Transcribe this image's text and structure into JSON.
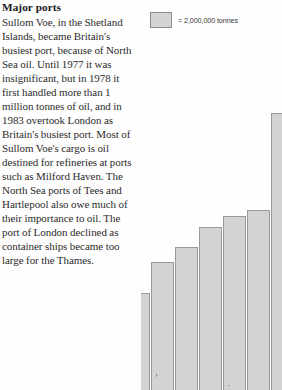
{
  "article": {
    "heading": "Major ports",
    "body": "Sullom Voe, in the Shetland Islands, became Britain's busiest port, because of North Sea oil. Until 1977 it was insignificant, but in 1978 it first handled more than 1 million tonnes of oil, and in 1983 overtook London as Britain's busiest port. Most of Sullom Voe's cargo is oil destined for refineries at ports such as Milford Haven. The North Sea ports of Tees and Hartlepool also owe much of their importance to oil. The port of London declined as container ships became too large for the Thames."
  },
  "legend": {
    "label": "= 2,000,000 tonnes",
    "swatch_color": "#d4d4d4",
    "swatch_border": "#8e8e8e"
  },
  "chart_data": {
    "type": "bar",
    "title": "Major ports",
    "xlabel": "",
    "ylabel": "",
    "unit": "tonnes",
    "legend_unit_value": 2000000,
    "legend_position": "top-left",
    "grid": false,
    "note": "Horizontally cropped bar chart; only the right-hand tail of an ascending series is visible. Bars are clipped at the bottom of the page and the tallest bar is clipped at the top.",
    "categories": [
      "Manchester",
      "Birmingham",
      "Southampton",
      "Grimsby & Immingham",
      "Tees & Hartlepool",
      "Forth",
      "Milford Haven",
      "London",
      "Sullom Voe"
    ],
    "visible_labels": [
      "nningham",
      "ton",
      "apool",
      "th"
    ],
    "values": [
      3,
      10,
      15,
      19,
      22,
      23,
      33,
      40,
      55
    ],
    "ylim": [
      0,
      58
    ],
    "bar_fill": "#d3d3d3",
    "bar_stroke": "#9a9a9a"
  },
  "bars": [
    {
      "name": "bar-partial-left",
      "left": -14,
      "width": 23,
      "height": 97,
      "label": ""
    },
    {
      "name": "bar-birmingham",
      "left": 10,
      "width": 23,
      "height": 128,
      "label": "nningham"
    },
    {
      "name": "bar-southampton",
      "left": 34,
      "width": 23,
      "height": 143,
      "label": "ton"
    },
    {
      "name": "bar-immingham",
      "left": 58,
      "width": 23,
      "height": 163,
      "label": ""
    },
    {
      "name": "bar-tees",
      "left": 82,
      "width": 23,
      "height": 174,
      "label": "apool"
    },
    {
      "name": "bar-forth",
      "left": 106,
      "width": 23,
      "height": 180,
      "label": ""
    },
    {
      "name": "bar-milford",
      "left": 130,
      "width": 23,
      "height": 277,
      "label": ""
    },
    {
      "name": "bar-london",
      "left": 154,
      "width": 23,
      "height": 297,
      "label": ""
    }
  ]
}
